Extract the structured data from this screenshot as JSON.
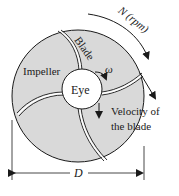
{
  "diagram": {
    "labels": {
      "speed": "N (rpm)",
      "blade": "Blade",
      "impeller": "Impeller",
      "omega": "ω",
      "eye": "Eye",
      "velocity_line1": "Velocity of",
      "velocity_line2": "the blade",
      "diameter": "D"
    },
    "colors": {
      "impeller_fill": "#d9d9d9",
      "eye_fill": "#ffffff",
      "stroke": "#1a1a1a"
    }
  }
}
